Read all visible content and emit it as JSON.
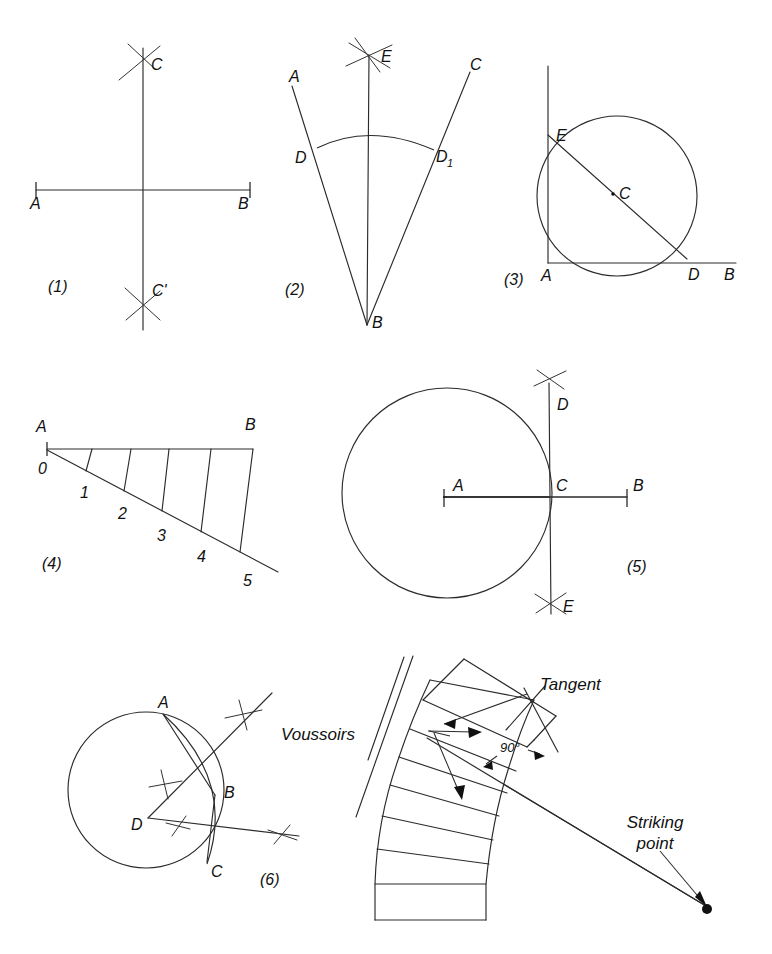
{
  "plate": {
    "title": "Geometric constructions and arch voussoir setting-out",
    "background_color": "#ffffff",
    "ink_color": "#2b2b2b",
    "width": 772,
    "height": 954
  },
  "figures": [
    {
      "id": "fig1",
      "number": "(1)",
      "caption": "Perpendicular bisector of a line",
      "points": [
        {
          "key": "A",
          "label": "A"
        },
        {
          "key": "B",
          "label": "B"
        },
        {
          "key": "C",
          "label": "C"
        },
        {
          "key": "Cp",
          "label": "C'"
        }
      ]
    },
    {
      "id": "fig2",
      "number": "(2)",
      "caption": "Bisecting an angle",
      "points": [
        {
          "key": "A",
          "label": "A"
        },
        {
          "key": "B",
          "label": "B"
        },
        {
          "key": "C",
          "label": "C"
        },
        {
          "key": "D",
          "label": "D"
        },
        {
          "key": "D1",
          "label": "D",
          "sub": "1"
        },
        {
          "key": "E",
          "label": "E"
        }
      ]
    },
    {
      "id": "fig3",
      "number": "(3)",
      "caption": "Perpendicular by semicircle (Thales)",
      "points": [
        {
          "key": "A",
          "label": "A"
        },
        {
          "key": "B",
          "label": "B"
        },
        {
          "key": "C",
          "label": "C"
        },
        {
          "key": "D",
          "label": "D"
        },
        {
          "key": "E",
          "label": "E"
        }
      ]
    },
    {
      "id": "fig4",
      "number": "(4)",
      "caption": "Dividing a line into equal parts",
      "points": [
        {
          "key": "A",
          "label": "A"
        },
        {
          "key": "B",
          "label": "B"
        }
      ],
      "divisions": [
        "0",
        "1",
        "2",
        "3",
        "4",
        "5"
      ]
    },
    {
      "id": "fig5",
      "number": "(5)",
      "caption": "Perpendicular to a line at a point on a circle",
      "points": [
        {
          "key": "A",
          "label": "A"
        },
        {
          "key": "B",
          "label": "B"
        },
        {
          "key": "C",
          "label": "C"
        },
        {
          "key": "D",
          "label": "D"
        },
        {
          "key": "E",
          "label": "E"
        }
      ]
    },
    {
      "id": "fig6",
      "number": "(6)",
      "caption": "Finding the centre of a circle",
      "points": [
        {
          "key": "A",
          "label": "A"
        },
        {
          "key": "B",
          "label": "B"
        },
        {
          "key": "C",
          "label": "C"
        },
        {
          "key": "D",
          "label": "D"
        }
      ]
    }
  ],
  "arch": {
    "id": "arch-diagram",
    "caption": "Setting out arch voussoirs from the striking point",
    "labels": {
      "voussoirs": "Voussoirs",
      "tangent": "Tangent",
      "angle": "90°",
      "striking_point_line1": "Striking",
      "striking_point_line2": "point"
    },
    "voussoir_count": 8
  }
}
